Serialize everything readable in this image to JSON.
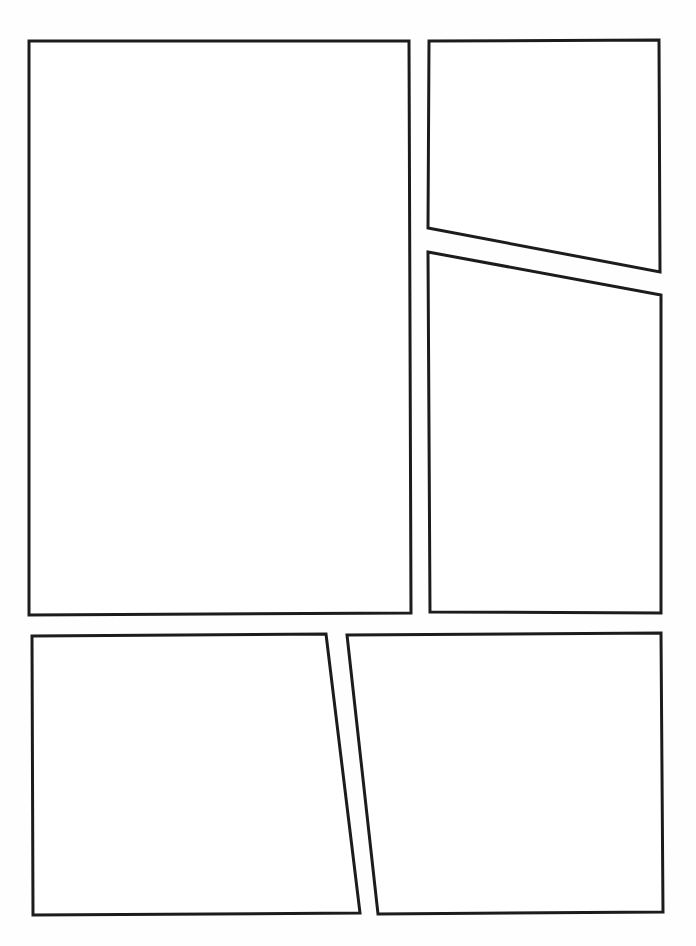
{
  "page": {
    "background_color": "#fefefe",
    "panel_fill_color": "#ffffff",
    "panel_border_color": "#1c1c1c",
    "panel_border_width": 3,
    "width": 696,
    "height": 946,
    "panel_count": 5,
    "gutter_note": "white gutters between panels"
  },
  "panels": [
    {
      "id": "panel-1",
      "label": "Panel 1",
      "row": 1,
      "position": "top-left",
      "shape": "rectangle",
      "points": "29,41 409,41 411,613 29,615"
    },
    {
      "id": "panel-2",
      "label": "Panel 2",
      "row": 1,
      "position": "top-right-upper",
      "shape": "quadrilateral",
      "points": "429,41 659,40 660,272 428,228"
    },
    {
      "id": "panel-3",
      "label": "Panel 3",
      "row": 1,
      "position": "right-lower",
      "shape": "quadrilateral",
      "points": "428,252 661,295 661,613 430,612"
    },
    {
      "id": "panel-4",
      "label": "Panel 4",
      "row": 2,
      "position": "bottom-left",
      "shape": "quadrilateral",
      "points": "32,636 326,634 360,913 33,915"
    },
    {
      "id": "panel-5",
      "label": "Panel 5",
      "row": 2,
      "position": "bottom-right",
      "shape": "quadrilateral",
      "points": "347,635 661,633 663,912 378,914"
    }
  ]
}
